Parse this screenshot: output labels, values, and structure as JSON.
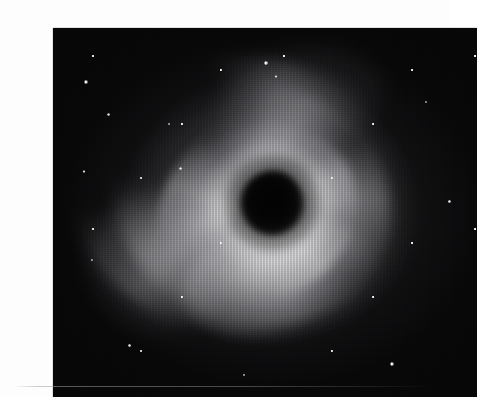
{
  "plate": {
    "title": "Spiral Nebula Photographic Plate",
    "caption": "",
    "medium": "halftone-engraving",
    "palette": {
      "page_background": "#fdfdfd",
      "plate_background": "#070708",
      "core_black": "#010101",
      "halo_bright": "#e8e8ea",
      "halo_mid": "#8c8c92",
      "star_white": "#ffffff",
      "border": "#c9c9c9"
    },
    "frame": {
      "left": 13,
      "top": 12,
      "width": 424,
      "height": 369
    }
  },
  "subject": {
    "kind": "spiral-nebula",
    "core": {
      "label": "dark occulting core",
      "center_x_pct": 51.6,
      "center_y_pct": 47.5,
      "radius_px": 31
    },
    "halo": {
      "label": "luminous halo",
      "inner_radius_px": 96,
      "mid_radius_px": 175,
      "outer_radius_px": 300
    },
    "arms": [
      {
        "name": "arm-upper-left",
        "label": "upper-left spiral arm"
      },
      {
        "name": "arm-upper-right",
        "label": "upper-right spiral arm"
      },
      {
        "name": "arm-lower",
        "label": "bright lower spiral arm"
      },
      {
        "name": "arm-left",
        "label": "western diffuse arm"
      }
    ]
  },
  "bright_stars": [
    {
      "name": "star-upper-left",
      "x_pct": 7.9,
      "y_pct": 14.6,
      "size_px": 4.0
    },
    {
      "name": "star-left-upper",
      "x_pct": 13.0,
      "y_pct": 23.5,
      "size_px": 3.2
    },
    {
      "name": "star-top-center",
      "x_pct": 50.2,
      "y_pct": 9.5,
      "size_px": 3.6
    },
    {
      "name": "star-top-center-b",
      "x_pct": 52.6,
      "y_pct": 13.1,
      "size_px": 2.8
    },
    {
      "name": "star-left-mid",
      "x_pct": 7.3,
      "y_pct": 38.8,
      "size_px": 2.8
    },
    {
      "name": "star-left-lower",
      "x_pct": 9.2,
      "y_pct": 62.9,
      "size_px": 2.6
    },
    {
      "name": "star-center-left",
      "x_pct": 27.4,
      "y_pct": 26.0,
      "size_px": 2.6
    },
    {
      "name": "star-inner-north",
      "x_pct": 30.0,
      "y_pct": 38.0,
      "size_px": 3.0
    },
    {
      "name": "star-lower-right",
      "x_pct": 80.0,
      "y_pct": 91.0,
      "size_px": 4.4
    },
    {
      "name": "star-right-upper",
      "x_pct": 88.0,
      "y_pct": 20.0,
      "size_px": 2.6
    },
    {
      "name": "star-right-mid",
      "x_pct": 93.5,
      "y_pct": 47.0,
      "size_px": 2.4
    },
    {
      "name": "star-bottom-left",
      "x_pct": 18.0,
      "y_pct": 86.0,
      "size_px": 2.6
    },
    {
      "name": "star-bottom-center",
      "x_pct": 45.0,
      "y_pct": 94.0,
      "size_px": 2.4
    }
  ]
}
